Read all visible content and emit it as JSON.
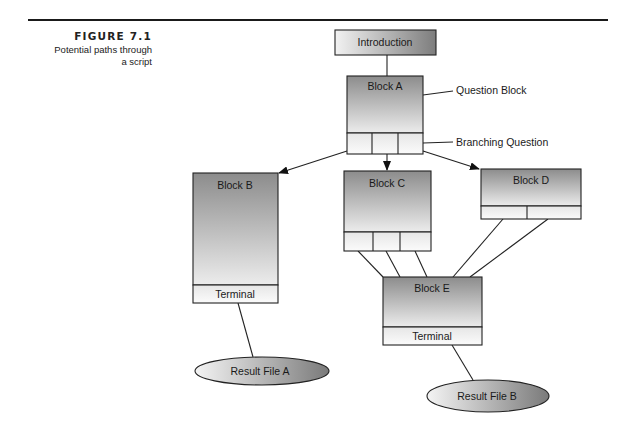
{
  "figure": {
    "number": "FIGURE 7.1",
    "caption_line1": "Potential paths through",
    "caption_line2": "a script"
  },
  "diagram": {
    "introduction": "Introduction",
    "block_a": "Block A",
    "block_b": "Block B",
    "block_c": "Block C",
    "block_d": "Block D",
    "block_e": "Block E",
    "terminal_b": "Terminal",
    "terminal_e": "Terminal",
    "result_a": "Result File A",
    "result_b": "Result File B",
    "annotation_question_block": "Question Block",
    "annotation_branching_question": "Branching Question"
  },
  "colors": {
    "line": "#222222",
    "dark_fill": "#8a8a8a",
    "light_fill": "#f4f4f4"
  }
}
